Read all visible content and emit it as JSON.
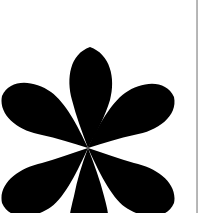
{
  "canvas": {
    "width": 209,
    "height": 213,
    "background_color": "#ffffff"
  },
  "artwork": {
    "name": "six-petal-flower-glyph",
    "label": "Six-petal flower asterisk glyph",
    "fill_color": "#000000",
    "center_x": 88,
    "center_y": 148,
    "petal_count": 6,
    "cropped_at_bottom": true,
    "petals": [
      {
        "name": "petal-top",
        "angle_deg": 270,
        "tip_x": 90,
        "tip_y": 45,
        "bulb_radius": 38
      },
      {
        "name": "petal-upper-left",
        "angle_deg": 205,
        "tip_x": 8,
        "tip_y": 100,
        "bulb_radius": 38
      },
      {
        "name": "petal-upper-right",
        "angle_deg": 335,
        "tip_x": 168,
        "tip_y": 102,
        "bulb_radius": 38
      },
      {
        "name": "petal-lower-left",
        "angle_deg": 155,
        "tip_x": 8,
        "tip_y": 190,
        "bulb_radius": 38
      },
      {
        "name": "petal-lower-right",
        "angle_deg": 25,
        "tip_x": 168,
        "tip_y": 192,
        "bulb_radius": 38
      },
      {
        "name": "petal-bottom",
        "angle_deg": 90,
        "tip_x": 90,
        "tip_y": 245,
        "bulb_radius": 38
      }
    ]
  },
  "divider": {
    "name": "vertical-page-divider",
    "orientation": "vertical",
    "x": 196,
    "thickness": 2,
    "color": "#9a9a9a"
  }
}
